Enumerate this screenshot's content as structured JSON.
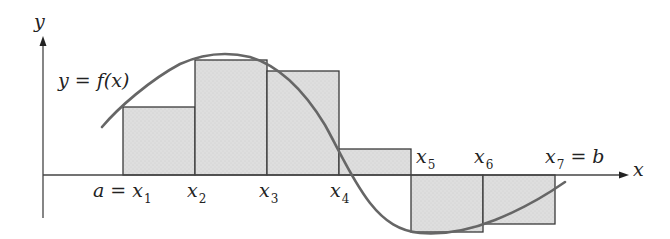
{
  "figure": {
    "axis_labels": {
      "x": "x",
      "y": "y"
    },
    "function_label": "y = f(x)",
    "point_labels": [
      {
        "id": "x1",
        "prefix": "a = ",
        "var": "x",
        "sub": "1",
        "left": 93,
        "top": 181
      },
      {
        "id": "x2",
        "prefix": "",
        "var": "x",
        "sub": "2",
        "left": 187,
        "top": 181
      },
      {
        "id": "x3",
        "prefix": "",
        "var": "x",
        "sub": "3",
        "left": 259,
        "top": 181
      },
      {
        "id": "x4",
        "prefix": "",
        "var": "x",
        "sub": "4",
        "left": 330,
        "top": 181
      },
      {
        "id": "x5",
        "prefix": "",
        "var": "x",
        "sub": "5",
        "left": 416,
        "top": 147
      },
      {
        "id": "x6",
        "prefix": "",
        "var": "x",
        "sub": "6",
        "left": 474,
        "top": 147
      },
      {
        "id": "x7",
        "prefix": "",
        "var": "x",
        "sub": "7",
        "suffix": " = b",
        "left": 545,
        "top": 147
      }
    ],
    "colors": {
      "rect_fill": "#dcdcdc",
      "rect_stroke": "#3a3a3a",
      "curve": "#666666",
      "axis": "#444444"
    }
  },
  "chart_data": {
    "type": "diagram",
    "xlabel": "x",
    "ylabel": "y",
    "function_label": "y = f(x)",
    "partition_points": [
      "a = x1",
      "x2",
      "x3",
      "x4",
      "x5",
      "x6",
      "x7 = b"
    ],
    "rectangles": [
      {
        "from": "x1",
        "to": "x2",
        "sign": "positive",
        "relative_height": 0.68
      },
      {
        "from": "x2",
        "to": "x3",
        "sign": "positive",
        "relative_height": 1.15
      },
      {
        "from": "x3",
        "to": "x4",
        "sign": "positive",
        "relative_height": 1.04
      },
      {
        "from": "x4",
        "to": "x5",
        "sign": "positive",
        "relative_height": 0.26
      },
      {
        "from": "x5",
        "to": "x6",
        "sign": "negative",
        "relative_height": -0.57
      },
      {
        "from": "x6",
        "to": "x7",
        "sign": "negative",
        "relative_height": -0.49
      }
    ]
  }
}
